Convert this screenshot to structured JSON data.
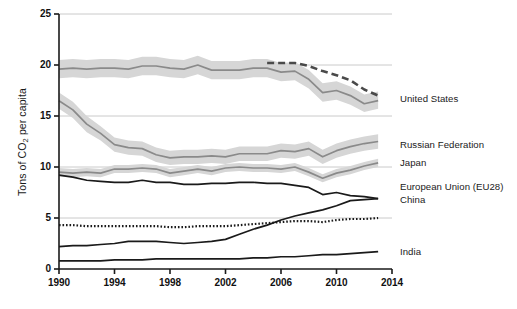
{
  "chart_data": {
    "type": "line",
    "title": "",
    "xlabel": "",
    "ylabel": "Tons of CO2 per capita",
    "ylabel_prefix": "Tons of CO",
    "ylabel_sub": "2",
    "ylabel_suffix": " per capita",
    "xlim": [
      1990,
      2014
    ],
    "ylim": [
      0,
      25
    ],
    "xticks": [
      1990,
      1994,
      1998,
      2002,
      2006,
      2010,
      2014
    ],
    "yticks": [
      0,
      5,
      10,
      15,
      20,
      25
    ],
    "xtick_labels": [
      "1990",
      "1994",
      "1998",
      "2002",
      "2006",
      "2010",
      "2014"
    ],
    "ytick_labels": [
      "0",
      "5",
      "10",
      "15",
      "20",
      "25"
    ],
    "grid": "horizontal",
    "legend_position": "right-inline",
    "x": [
      1990,
      1991,
      1992,
      1993,
      1994,
      1995,
      1996,
      1997,
      1998,
      1999,
      2000,
      2001,
      2002,
      2003,
      2004,
      2005,
      2006,
      2007,
      2008,
      2009,
      2010,
      2011,
      2012,
      2013
    ],
    "series": [
      {
        "name": "United States",
        "label": "United States",
        "style": "solid-with-band",
        "color": "#8a8a8a",
        "band_color": "#d6d6d6",
        "values": [
          19.6,
          19.7,
          19.6,
          19.7,
          19.7,
          19.6,
          19.9,
          19.9,
          19.7,
          19.6,
          20.0,
          19.5,
          19.5,
          19.5,
          19.7,
          19.7,
          19.3,
          19.4,
          18.6,
          17.3,
          17.5,
          17.0,
          16.2,
          16.5
        ],
        "band_low": [
          18.7,
          18.8,
          18.7,
          18.8,
          18.8,
          18.7,
          19.0,
          19.0,
          18.8,
          18.7,
          19.1,
          18.6,
          18.6,
          18.6,
          18.8,
          18.8,
          18.4,
          18.5,
          17.7,
          16.4,
          16.6,
          16.1,
          15.4,
          15.7
        ],
        "band_high": [
          20.5,
          20.6,
          20.5,
          20.6,
          20.6,
          20.5,
          20.8,
          20.8,
          20.6,
          20.5,
          20.9,
          20.4,
          20.4,
          20.4,
          20.6,
          20.6,
          20.2,
          20.3,
          19.5,
          18.2,
          18.4,
          17.9,
          17.1,
          17.4
        ]
      },
      {
        "name": "United States dashed",
        "label": "",
        "style": "dashed",
        "color": "#4a4a4a",
        "values": [
          null,
          null,
          null,
          null,
          null,
          null,
          null,
          null,
          null,
          null,
          null,
          null,
          null,
          null,
          null,
          20.2,
          20.2,
          20.2,
          19.9,
          19.4,
          19.0,
          18.5,
          17.6,
          17.0
        ]
      },
      {
        "name": "Russian Federation",
        "label": "Russian Federation",
        "style": "solid-with-band",
        "color": "#8a8a8a",
        "band_color": "#d6d6d6",
        "values": [
          16.5,
          15.6,
          14.2,
          13.3,
          12.2,
          11.9,
          11.8,
          11.2,
          10.9,
          11.0,
          11.0,
          11.1,
          11.0,
          11.3,
          11.3,
          11.3,
          11.6,
          11.5,
          11.8,
          11.0,
          11.6,
          12.0,
          12.3,
          12.5
        ],
        "band_low": [
          15.7,
          14.8,
          13.4,
          12.6,
          11.5,
          11.2,
          11.1,
          10.5,
          10.2,
          10.3,
          10.3,
          10.4,
          10.3,
          10.6,
          10.6,
          10.6,
          10.9,
          10.8,
          11.1,
          10.3,
          10.9,
          11.3,
          11.6,
          11.8
        ],
        "band_high": [
          17.3,
          16.4,
          15.0,
          14.0,
          12.9,
          12.6,
          12.5,
          11.9,
          11.6,
          11.7,
          11.7,
          11.8,
          11.7,
          12.0,
          12.0,
          12.0,
          12.3,
          12.2,
          12.5,
          11.7,
          12.3,
          12.7,
          13.0,
          13.2
        ]
      },
      {
        "name": "Japan",
        "label": "Japan",
        "style": "solid-with-band",
        "color": "#8a8a8a",
        "band_color": "#d6d6d6",
        "values": [
          9.5,
          9.4,
          9.5,
          9.4,
          9.8,
          9.8,
          9.9,
          9.8,
          9.4,
          9.6,
          9.8,
          9.6,
          9.9,
          10.0,
          9.9,
          9.9,
          9.8,
          10.0,
          9.5,
          8.9,
          9.4,
          9.7,
          10.1,
          10.4
        ],
        "band_low": [
          9.1,
          9.0,
          9.1,
          9.0,
          9.4,
          9.4,
          9.5,
          9.4,
          9.0,
          9.2,
          9.4,
          9.2,
          9.5,
          9.6,
          9.5,
          9.5,
          9.4,
          9.6,
          9.1,
          8.5,
          9.0,
          9.3,
          9.7,
          10.0
        ],
        "band_high": [
          9.9,
          9.8,
          9.9,
          9.8,
          10.2,
          10.2,
          10.3,
          10.2,
          9.8,
          10.0,
          10.2,
          10.0,
          10.3,
          10.4,
          10.3,
          10.3,
          10.2,
          10.4,
          9.9,
          9.3,
          9.8,
          10.1,
          10.5,
          10.8
        ]
      },
      {
        "name": "European Union (EU28)",
        "label": "European Union (EU28)",
        "style": "solid",
        "color": "#1a1a1a",
        "values": [
          9.2,
          9.0,
          8.7,
          8.6,
          8.5,
          8.5,
          8.7,
          8.5,
          8.5,
          8.3,
          8.3,
          8.4,
          8.4,
          8.5,
          8.5,
          8.4,
          8.4,
          8.2,
          8.0,
          7.3,
          7.5,
          7.2,
          7.1,
          6.9
        ]
      },
      {
        "name": "China",
        "label": "China",
        "style": "solid",
        "color": "#1a1a1a",
        "values": [
          2.2,
          2.3,
          2.3,
          2.4,
          2.5,
          2.7,
          2.7,
          2.7,
          2.6,
          2.5,
          2.6,
          2.7,
          2.9,
          3.4,
          3.9,
          4.3,
          4.8,
          5.2,
          5.5,
          5.8,
          6.2,
          6.7,
          6.8,
          6.9
        ]
      },
      {
        "name": "World dotted",
        "label": "",
        "style": "dotted",
        "color": "#1a1a1a",
        "values": [
          4.3,
          4.3,
          4.2,
          4.2,
          4.2,
          4.2,
          4.2,
          4.2,
          4.1,
          4.1,
          4.2,
          4.2,
          4.2,
          4.3,
          4.4,
          4.5,
          4.6,
          4.7,
          4.7,
          4.6,
          4.8,
          4.9,
          4.9,
          5.0
        ]
      },
      {
        "name": "India",
        "label": "India",
        "style": "solid",
        "color": "#1a1a1a",
        "values": [
          0.8,
          0.8,
          0.8,
          0.8,
          0.9,
          0.9,
          0.9,
          1.0,
          1.0,
          1.0,
          1.0,
          1.0,
          1.0,
          1.0,
          1.1,
          1.1,
          1.2,
          1.2,
          1.3,
          1.4,
          1.4,
          1.5,
          1.6,
          1.7
        ]
      }
    ],
    "legend": [
      {
        "label": "United States",
        "y_px": 99
      },
      {
        "label": "Russian Federation",
        "y_px": 145
      },
      {
        "label": "Japan",
        "y_px": 163
      },
      {
        "label": "European Union (EU28)",
        "y_px": 187
      },
      {
        "label": "China",
        "y_px": 200
      },
      {
        "label": "India",
        "y_px": 252
      }
    ]
  },
  "colors": {
    "line_gray": "#8a8a8a",
    "band_gray": "#d6d6d6",
    "line_black": "#1a1a1a",
    "dash_dark": "#4a4a4a",
    "axis": "#1a1a1a",
    "grid": "#bdbdbd",
    "background": "#ffffff"
  }
}
